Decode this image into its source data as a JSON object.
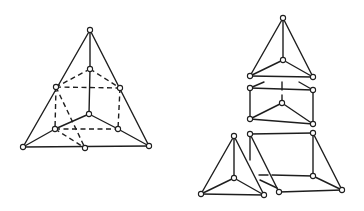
{
  "diagram": {
    "title": "",
    "colors": {
      "line": "#1e1e1e",
      "node_fill": "#ffffff",
      "background": "#ffffff"
    },
    "node_radius": 2.6,
    "figures": [
      {
        "id": "assembled-tetrahedron-with-inner-prism",
        "nodes": [
          [
            90,
            30
          ],
          [
            90,
            69
          ],
          [
            56,
            87
          ],
          [
            120,
            88
          ],
          [
            89,
            114
          ],
          [
            55,
            129
          ],
          [
            118,
            129
          ],
          [
            23,
            147
          ],
          [
            85,
            148
          ],
          [
            149,
            146
          ]
        ],
        "solid_edges": [
          [
            [
              90,
              30
            ],
            [
              23,
              147
            ]
          ],
          [
            [
              90,
              30
            ],
            [
              149,
              146
            ]
          ],
          [
            [
              23,
              147
            ],
            [
              149,
              146
            ]
          ],
          [
            [
              90,
              30
            ],
            [
              90,
              69
            ]
          ],
          [
            [
              90,
              69
            ],
            [
              89,
              114
            ]
          ],
          [
            [
              89,
              114
            ],
            [
              55,
              129
            ]
          ],
          [
            [
              89,
              114
            ],
            [
              118,
              129
            ]
          ],
          [
            [
              23,
              147
            ],
            [
              55,
              129
            ]
          ],
          [
            [
              149,
              146
            ],
            [
              118,
              129
            ]
          ]
        ],
        "dashed_edges": [
          [
            [
              90,
              69
            ],
            [
              56,
              87
            ]
          ],
          [
            [
              90,
              69
            ],
            [
              120,
              88
            ]
          ],
          [
            [
              56,
              87
            ],
            [
              120,
              88
            ]
          ],
          [
            [
              56,
              87
            ],
            [
              55,
              129
            ]
          ],
          [
            [
              120,
              88
            ],
            [
              118,
              129
            ]
          ],
          [
            [
              55,
              129
            ],
            [
              118,
              129
            ]
          ],
          [
            [
              56,
              87
            ],
            [
              85,
              148
            ]
          ],
          [
            [
              55,
              129
            ],
            [
              85,
              148
            ]
          ]
        ]
      },
      {
        "id": "top-small-tetrahedron",
        "nodes": [
          [
            283,
            18
          ],
          [
            283,
            60
          ],
          [
            250,
            76
          ],
          [
            313,
            77
          ]
        ],
        "solid_edges": [
          [
            [
              283,
              18
            ],
            [
              250,
              76
            ]
          ],
          [
            [
              283,
              18
            ],
            [
              313,
              77
            ]
          ],
          [
            [
              250,
              76
            ],
            [
              313,
              77
            ]
          ],
          [
            [
              283,
              18
            ],
            [
              283,
              60
            ]
          ],
          [
            [
              283,
              60
            ],
            [
              250,
              76
            ]
          ],
          [
            [
              283,
              60
            ],
            [
              313,
              77
            ]
          ]
        ],
        "dashed_edges": []
      },
      {
        "id": "middle-prism",
        "nodes": [
          [
            250,
            88
          ],
          [
            313,
            90
          ],
          [
            282,
            103
          ],
          [
            250,
            119
          ],
          [
            313,
            124
          ]
        ],
        "solid_edges": [
          [
            [
              250,
              88
            ],
            [
              313,
              90
            ]
          ],
          [
            [
              250,
              88
            ],
            [
              250,
              119
            ]
          ],
          [
            [
              313,
              90
            ],
            [
              313,
              124
            ]
          ],
          [
            [
              250,
              119
            ],
            [
              313,
              124
            ]
          ],
          [
            [
              282,
              103
            ],
            [
              250,
              119
            ]
          ],
          [
            [
              282,
              103
            ],
            [
              313,
              124
            ]
          ]
        ],
        "broken_edges": [
          [
            [
              250,
              88
            ],
            [
              264,
              82
            ]
          ],
          [
            [
              299,
              82
            ],
            [
              313,
              90
            ]
          ],
          [
            [
              282,
              82
            ],
            [
              282,
              90
            ]
          ],
          [
            [
              282,
              95
            ],
            [
              282,
              103
            ]
          ]
        ]
      },
      {
        "id": "bottom-left-small-tetrahedron",
        "nodes": [
          [
            234,
            136
          ],
          [
            234,
            178
          ],
          [
            201,
            194
          ],
          [
            264,
            195
          ]
        ],
        "solid_edges": [
          [
            [
              234,
              136
            ],
            [
              201,
              194
            ]
          ],
          [
            [
              234,
              136
            ],
            [
              264,
              195
            ]
          ],
          [
            [
              201,
              194
            ],
            [
              264,
              195
            ]
          ],
          [
            [
              234,
              136
            ],
            [
              234,
              178
            ]
          ],
          [
            [
              234,
              178
            ],
            [
              201,
              194
            ]
          ],
          [
            [
              234,
              178
            ],
            [
              264,
              195
            ]
          ]
        ],
        "dashed_edges": []
      },
      {
        "id": "bottom-right-prism",
        "nodes": [
          [
            250,
            134
          ],
          [
            313,
            133
          ],
          [
            313,
            176
          ],
          [
            279,
            192
          ],
          [
            342,
            190
          ]
        ],
        "solid_edges": [
          [
            [
              250,
              134
            ],
            [
              313,
              133
            ]
          ],
          [
            [
              313,
              133
            ],
            [
              313,
              176
            ]
          ],
          [
            [
              313,
              133
            ],
            [
              342,
              190
            ]
          ],
          [
            [
              250,
              134
            ],
            [
              279,
              192
            ]
          ],
          [
            [
              279,
              192
            ],
            [
              342,
              190
            ]
          ],
          [
            [
              313,
              176
            ],
            [
              342,
              190
            ]
          ],
          [
            [
              250,
              134
            ],
            [
              250,
              160
            ]
          ]
        ],
        "broken_edges": [
          [
            [
              272,
              175
            ],
            [
              313,
              176
            ]
          ],
          [
            [
              259,
              175
            ],
            [
              268,
              175
            ]
          ],
          [
            [
              260,
              180
            ],
            [
              277,
              188
            ]
          ]
        ]
      }
    ]
  }
}
